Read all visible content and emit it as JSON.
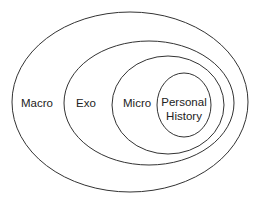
{
  "diagram": {
    "type": "nested-ellipses",
    "stroke_color": "#333333",
    "background": "#ffffff",
    "levels": [
      {
        "id": "macro",
        "label": "Macro",
        "cx": 130,
        "cy": 102,
        "rx": 118,
        "ry": 90
      },
      {
        "id": "exo",
        "label": "Exo",
        "cx": 149,
        "cy": 103,
        "rx": 85,
        "ry": 62
      },
      {
        "id": "micro",
        "label": "Micro",
        "cx": 168,
        "cy": 105,
        "rx": 56,
        "ry": 49
      },
      {
        "id": "personal",
        "label_line1": "Personal",
        "label_line2": "History",
        "cx": 184,
        "cy": 105,
        "rx": 27,
        "ry": 32
      }
    ]
  }
}
